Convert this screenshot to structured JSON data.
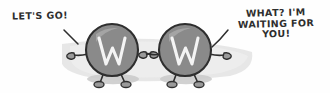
{
  "panel": {
    "type": "comic-strip-panel",
    "width": 330,
    "height": 93,
    "background_color": "#fefefe",
    "ground_band_color": "#e4e4e4",
    "shadow_color": "#c9c9c9",
    "ink_color": "#2e2e2e",
    "body_fill_color": "#8a8a8a",
    "body_highlight_color": "#a6a6a6",
    "letter_color": "#f4f4f4"
  },
  "captions": {
    "left": {
      "text": "LET'S GO!",
      "speaker": "left-character"
    },
    "right": {
      "text": "WHAT? I'M\nWAITING FOR YOU!",
      "speaker": "right-character"
    }
  },
  "characters": [
    {
      "id": "left-character",
      "label": "W",
      "facing": "right",
      "body_shape": "circle",
      "fill": "#8a8a8a",
      "outline": "#2e2e2e",
      "letter_color": "#f4f4f4",
      "center_x": 112,
      "center_y": 50,
      "radius": 26
    },
    {
      "id": "right-character",
      "label": "W",
      "facing": "left",
      "body_shape": "circle",
      "fill": "#8a8a8a",
      "outline": "#2e2e2e",
      "letter_color": "#f4f4f4",
      "center_x": 185,
      "center_y": 50,
      "radius": 26
    }
  ]
}
